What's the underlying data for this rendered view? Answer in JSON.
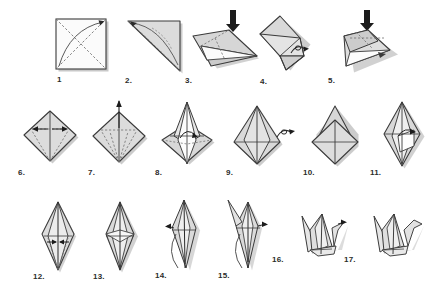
{
  "document": {
    "title": "Origami Crane Folding Instructions",
    "type": "instructional-diagram",
    "background_color": "#ffffff",
    "rows": 3,
    "total_steps": 17
  },
  "palette": {
    "paper_light": "#e9e9e9",
    "paper_mid": "#d2d2d2",
    "paper_dark": "#b4b4b4",
    "paper_shadow": "#9a9a9a",
    "paper_white": "#fdfdfd",
    "outline": "#3a3a3a",
    "crease_dashed": "#6e6e6e",
    "arrow": "#1c1c1c",
    "drop_shadow": "#8c8c8c",
    "label_color": "#2b2b2b"
  },
  "steps": [
    {
      "number": "1",
      "label": "1",
      "caption": "Square sheet with diagonal creases",
      "symbols": [
        "curved-fold-arrow",
        "dashed-diagonals"
      ]
    },
    {
      "number": "2",
      "label": "2.",
      "caption": "Folded into a triangle",
      "symbols": [
        "curved-fold-arrow",
        "dashed-crease"
      ]
    },
    {
      "number": "3",
      "label": "3.",
      "caption": "Fold corner down",
      "symbols": [
        "straight-down-arrow",
        "dashed-crease"
      ]
    },
    {
      "number": "4",
      "label": "4.",
      "caption": "Square base front view",
      "symbols": [
        "turn-over-symbol"
      ]
    },
    {
      "number": "5",
      "label": "5.",
      "caption": "Fold the remaining flap down",
      "symbols": [
        "straight-down-arrow",
        "dashed-crease"
      ]
    },
    {
      "number": "6",
      "label": "6.",
      "caption": "Diamond with centre creases",
      "symbols": [
        "inward-arrows",
        "dashed-crease"
      ]
    },
    {
      "number": "7",
      "label": "7.",
      "caption": "Petal fold preparation",
      "symbols": [
        "up-arrow",
        "dashed-crease"
      ]
    },
    {
      "number": "8",
      "label": "8.",
      "caption": "Lift the front flap",
      "symbols": [
        "lift-arrow"
      ]
    },
    {
      "number": "9",
      "label": "9.",
      "caption": "Petal fold complete",
      "symbols": [
        "turn-over-symbol"
      ]
    },
    {
      "number": "10",
      "label": "10.",
      "caption": "Repeat on the reverse side",
      "symbols": []
    },
    {
      "number": "11",
      "label": "11.",
      "caption": "Bird base",
      "symbols": [
        "lift-arrow"
      ]
    },
    {
      "number": "12",
      "label": "12.",
      "caption": "Fold lower edges to centre",
      "symbols": [
        "inward-arrows",
        "dashed-crease"
      ]
    },
    {
      "number": "13",
      "label": "13.",
      "caption": "Both sides folded in",
      "symbols": []
    },
    {
      "number": "14",
      "label": "14.",
      "caption": "Inside reverse fold the neck",
      "symbols": [
        "reverse-fold-arrow"
      ]
    },
    {
      "number": "15",
      "label": "15.",
      "caption": "Inside reverse fold the tail",
      "symbols": [
        "reverse-fold-arrow"
      ]
    },
    {
      "number": "16",
      "label": "16.",
      "caption": "Form the head",
      "symbols": [
        "head-fold-arrow"
      ]
    },
    {
      "number": "17",
      "label": "17.",
      "caption": "Finished paper crane",
      "symbols": []
    }
  ],
  "symbols": {
    "turn_over_1": {
      "name": "turn-over-symbol",
      "between": "4-5"
    },
    "turn_over_2": {
      "name": "turn-over-symbol",
      "between": "9-10"
    },
    "arrow_step3": {
      "name": "down-arrow",
      "step": "3"
    },
    "arrow_step5": {
      "name": "down-arrow",
      "step": "5"
    }
  }
}
